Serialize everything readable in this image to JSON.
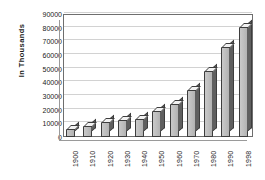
{
  "chart_data": {
    "type": "bar",
    "title": "",
    "xlabel": "",
    "ylabel": "In Thousands",
    "categories": [
      "1900",
      "1910",
      "1920",
      "1930",
      "1940",
      "1950",
      "1960",
      "1970",
      "1980",
      "1990",
      "1998"
    ],
    "values": [
      5500,
      8000,
      11000,
      12500,
      13000,
      19000,
      24500,
      34500,
      48500,
      65500,
      80500
    ],
    "ylim": [
      0,
      90000
    ],
    "ytick_labels": [
      "90000",
      "80000",
      "70000",
      "60000",
      "50000",
      "40000",
      "30000",
      "20000",
      "10000",
      "0"
    ],
    "ytick_values": [
      90000,
      80000,
      70000,
      60000,
      50000,
      40000,
      30000,
      20000,
      10000,
      0
    ],
    "ytick_step": 10000,
    "grid": true,
    "legend": false,
    "style_3d": true,
    "colors": {
      "bar_front": "#bdbdbd",
      "bar_side": "#5f5f5f",
      "bar_top": "#f2f2f2",
      "bar_outline": "#3d3d3d",
      "gridline": "#d2d2d2",
      "axis": "#6e6e6e",
      "text": "#1a1a1a",
      "background": "#ffffff"
    }
  }
}
